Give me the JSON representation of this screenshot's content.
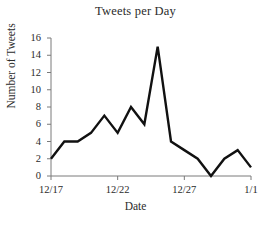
{
  "chart_data": {
    "type": "line",
    "title": "Tweets per Day",
    "xlabel": "Date",
    "ylabel": "Number of Tweets",
    "x": [
      "12/17",
      "12/18",
      "12/19",
      "12/20",
      "12/21",
      "12/22",
      "12/23",
      "12/24",
      "12/25",
      "12/26",
      "12/27",
      "12/28",
      "12/29",
      "12/30",
      "12/31",
      "1/1"
    ],
    "values": [
      2,
      4,
      4,
      5,
      7,
      5,
      8,
      6,
      15,
      4,
      3,
      2,
      0,
      2,
      3,
      1
    ],
    "ylim": [
      0,
      16
    ],
    "yticks": [
      0,
      2,
      4,
      6,
      8,
      10,
      12,
      14,
      16
    ],
    "ytick_labels": [
      "0",
      "2",
      "4",
      "6",
      "8",
      "10",
      "12",
      "14",
      "16"
    ],
    "xticks": [
      "12/17",
      "12/22",
      "12/27",
      "1/1"
    ],
    "xtick_labels": [
      "12/17",
      "12/22",
      "12/27",
      "1/1"
    ],
    "grid": false,
    "legend": false,
    "line_color": "#111111",
    "axis_color": "#7a7a7a"
  }
}
